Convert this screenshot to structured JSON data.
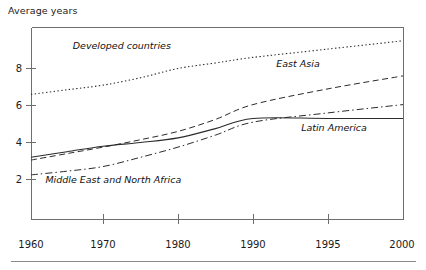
{
  "chart_data": {
    "type": "line",
    "title": "Average years",
    "xlabel": "",
    "ylabel": "Average years",
    "grid": false,
    "legend_position": "inline-annotations",
    "x": [
      1960,
      1965,
      1970,
      1975,
      1980,
      1985,
      1990,
      1995,
      2000
    ],
    "x_ticks": [
      1960,
      1970,
      1980,
      1990,
      1995,
      2000
    ],
    "x_tick_labels": [
      "1960",
      "1970",
      "1980",
      "1990",
      "1995",
      "2000"
    ],
    "y_ticks": [
      2,
      4,
      6,
      8
    ],
    "y_tick_labels": [
      "2",
      "4",
      "6",
      "8"
    ],
    "ylim": [
      0.8,
      9.9
    ],
    "xlim_note": "axis spacing is non-linear: 1990-1995 and 1995-2000 occupy the same width as each 10-year interval",
    "series": [
      {
        "name": "Developed countries",
        "style": "dotted",
        "label_x": 1972.5,
        "label_y": 9.05,
        "values": [
          6.6,
          6.85,
          7.1,
          7.5,
          8.0,
          8.3,
          8.6,
          9.05,
          9.5
        ]
      },
      {
        "name": "East Asia",
        "style": "dashed",
        "label_x": 1993.0,
        "label_y": 8.1,
        "values": [
          3.05,
          3.4,
          3.75,
          4.15,
          4.6,
          5.25,
          6.05,
          6.9,
          7.6
        ]
      },
      {
        "name": "Latin America",
        "style": "solid",
        "label_x": 1995.4,
        "label_y": 4.65,
        "values": [
          3.2,
          3.5,
          3.8,
          4.0,
          4.25,
          4.75,
          5.3,
          5.3,
          5.3
        ]
      },
      {
        "name": "Middle East and North Africa",
        "style": "dash-dot",
        "label_x": 1962.0,
        "label_y": 1.82,
        "values": [
          2.25,
          2.45,
          2.7,
          3.2,
          3.75,
          4.4,
          5.1,
          5.6,
          6.05
        ]
      }
    ]
  },
  "colors": {
    "line": "#2b2b2b",
    "axis": "#6e6e6e",
    "text": "#1a1a1a",
    "rule": "#8a8a8a",
    "background": "#ffffff"
  }
}
